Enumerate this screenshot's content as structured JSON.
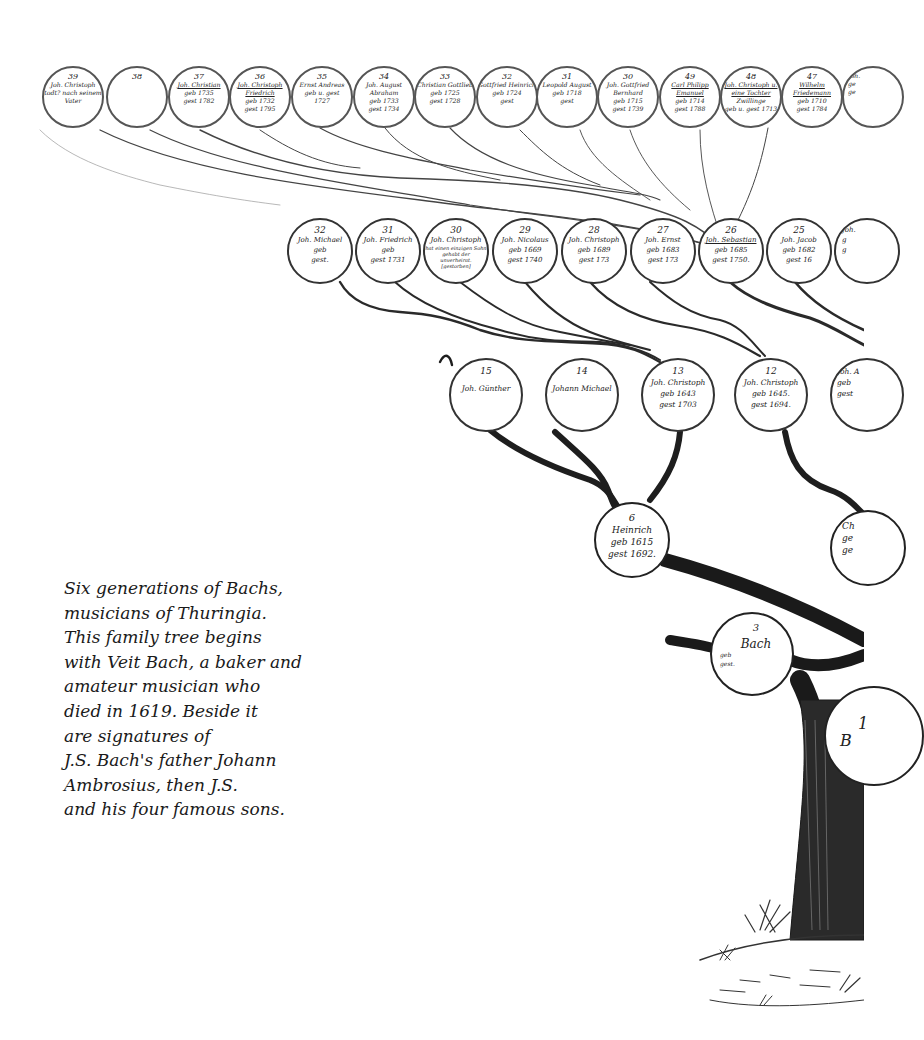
{
  "caption": {
    "lines": [
      "Six generations of Bachs,",
      "musicians of Thuringia.",
      "This family tree begins",
      "with Veit Bach, a baker and",
      "amateur musician who",
      "died in 1619. Beside it",
      "are signatures of",
      "J.S. Bach's father Johann",
      "Ambrosius, then J.S.",
      "and his four famous sons."
    ]
  },
  "tree": {
    "row_top": [
      {
        "num": "39",
        "name": "Joh. Christoph",
        "l1": "todt? nach seinem",
        "l2": "Vater"
      },
      {
        "num": "38",
        "name": "",
        "l1": "",
        "l2": ""
      },
      {
        "num": "37",
        "name": "Joh. Christian",
        "l1": "geb 1735",
        "l2": "gest 1782"
      },
      {
        "num": "36",
        "name": "Joh. Christoph Friedrich",
        "l1": "geb 1732",
        "l2": "gest 1795"
      },
      {
        "num": "35",
        "name": "Ernst Andreas",
        "l1": "geb u. gest",
        "l2": "1727"
      },
      {
        "num": "34",
        "name": "Joh. August Abraham",
        "l1": "geb 1733",
        "l2": "gest 1734"
      },
      {
        "num": "33",
        "name": "Christian Gottlieb",
        "l1": "geb 1725",
        "l2": "gest 1728"
      },
      {
        "num": "32",
        "name": "Gottfried Heinrich",
        "l1": "geb 1724",
        "l2": "gest"
      },
      {
        "num": "31",
        "name": "Leopold August",
        "l1": "geb 1718",
        "l2": "gest"
      },
      {
        "num": "30",
        "name": "Joh. Gottfried Bernhard",
        "l1": "geb 1715",
        "l2": "gest 1739"
      },
      {
        "num": "49",
        "name": "Carl Philipp Emanuel",
        "l1": "geb 1714",
        "l2": "gest 1788"
      },
      {
        "num": "48",
        "name": "Joh. Christoph u. eine Tochter",
        "l1": "Zwillinge",
        "l2": "geb u. gest 1713"
      },
      {
        "num": "47",
        "name": "Wilhelm Friedemann",
        "l1": "geb 1710",
        "l2": "gest 1784"
      },
      {
        "num": "",
        "name": "Joh.",
        "l1": "ge",
        "l2": "ge"
      }
    ],
    "row_second": [
      {
        "num": "32",
        "name": "Joh. Michael",
        "l1": "geb",
        "l2": "gest."
      },
      {
        "num": "31",
        "name": "Joh. Friedrich",
        "l1": "geb",
        "l2": "gest 1731"
      },
      {
        "num": "30",
        "name": "Joh. Christoph",
        "l1": "hat einen einzigen Sohn gehabt der",
        "l2": "unverheirat. [gestorben]"
      },
      {
        "num": "29",
        "name": "Joh. Nicolaus",
        "l1": "geb 1669",
        "l2": "gest 1740"
      },
      {
        "num": "28",
        "name": "Joh. Christoph",
        "l1": "geb 1689",
        "l2": "gest 173"
      },
      {
        "num": "27",
        "name": "Joh. Ernst",
        "l1": "geb 1683",
        "l2": "gest 173"
      },
      {
        "num": "26",
        "name": "Joh. Sebastian",
        "l1": "geb 1685",
        "l2": "gest 1750."
      },
      {
        "num": "25",
        "name": "Joh. Jacob",
        "l1": "geb 1682",
        "l2": "gest 16"
      },
      {
        "num": "",
        "name": "Joh.",
        "l1": "g",
        "l2": "g"
      }
    ],
    "row_third": [
      {
        "num": "15",
        "name": "Joh. Günther",
        "l1": "",
        "l2": ""
      },
      {
        "num": "14",
        "name": "Johann Michael",
        "l1": "",
        "l2": ""
      },
      {
        "num": "13",
        "name": "Joh. Christoph",
        "l1": "geb 1643",
        "l2": "gest 1703"
      },
      {
        "num": "12",
        "name": "Joh. Christoph",
        "l1": "geb 1645.",
        "l2": "gest 1694."
      },
      {
        "num": "",
        "name": "Joh. A",
        "l1": "geb",
        "l2": "gest"
      }
    ],
    "row_fourth": [
      {
        "num": "6",
        "name": "Heinrich",
        "l1": "geb 1615",
        "l2": "gest 1692."
      },
      {
        "num": "",
        "name": "Ch",
        "l1": "ge",
        "l2": "ge"
      }
    ],
    "row_fifth": [
      {
        "num": "3",
        "name": "Bach",
        "l1": "geb",
        "l2": "gest."
      },
      {
        "num": "1",
        "name": "B"
      }
    ]
  },
  "colors": {
    "ink": "#1e1e1e",
    "paper": "#ffffff",
    "caption_text": "#1a1a1a"
  }
}
